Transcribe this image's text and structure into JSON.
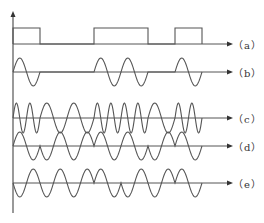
{
  "diagram": {
    "bits": [
      1,
      0,
      0,
      1,
      1,
      0,
      1
    ],
    "geometry": {
      "x0": 13,
      "bit_width": 27,
      "axis_end_x": 233,
      "axis_top_y": 11,
      "axis_bottom_y": 213
    },
    "colors": {
      "stroke": "#555555",
      "label": "#333333",
      "background": "#ffffff"
    },
    "rows": [
      {
        "id": "a",
        "label": "（a）",
        "type": "baseband",
        "baseline": 44,
        "amplitude": 16,
        "label_y": 37
      },
      {
        "id": "b",
        "label": "（b）",
        "type": "ask",
        "baseline": 72,
        "amplitude": 14,
        "label_y": 65
      },
      {
        "id": "c",
        "label": "（c）",
        "type": "fsk",
        "baseline": 118,
        "amplitude": 15,
        "label_y": 111,
        "freq_one": 2,
        "freq_zero": 1
      },
      {
        "id": "d",
        "label": "（d）",
        "type": "psk",
        "baseline": 146,
        "amplitude": 14,
        "label_y": 139
      },
      {
        "id": "e",
        "label": "（e）",
        "type": "dpsk",
        "baseline": 183,
        "amplitude": 14,
        "label_y": 176
      }
    ]
  }
}
